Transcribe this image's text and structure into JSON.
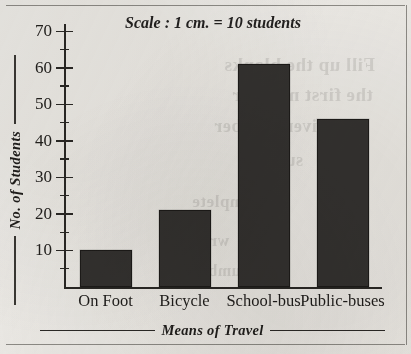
{
  "chart_data": {
    "type": "bar",
    "title": "Scale : 1 cm. = 10 students",
    "xlabel": "Means of Travel",
    "ylabel": "No. of Students",
    "categories": [
      "On Foot",
      "Bicycle",
      "School-bus",
      "Public-buses"
    ],
    "values": [
      10,
      21,
      61,
      46
    ],
    "ylim": [
      0,
      72
    ],
    "y_major_ticks": [
      10,
      20,
      30,
      40,
      50,
      60,
      70
    ],
    "y_minor_ticks": [
      5,
      15,
      25,
      35,
      45,
      55,
      65
    ],
    "y_tick_labels": [
      "10",
      "20",
      "30",
      "40",
      "50",
      "60",
      "70"
    ],
    "grid": false,
    "legend": "none",
    "bar_color": "#343230",
    "bar_edge_color": "#1d1b19",
    "axis_color": "#2a2825",
    "background_color": "#edebe7"
  },
  "ghost_text": [
    {
      "text": "Fill up the blanks",
      "left": 224,
      "top": 54,
      "size": 19
    },
    {
      "text": "the first number",
      "left": 232,
      "top": 84,
      "size": 19
    },
    {
      "text": "the given number",
      "left": 214,
      "top": 116,
      "size": 18
    },
    {
      "text": "sums",
      "left": 262,
      "top": 150,
      "size": 18
    },
    {
      "text": "Complete",
      "left": 192,
      "top": 192,
      "size": 17
    },
    {
      "text": "written",
      "left": 176,
      "top": 232,
      "size": 16
    },
    {
      "text": "numbers",
      "left": 186,
      "top": 262,
      "size": 16
    }
  ]
}
